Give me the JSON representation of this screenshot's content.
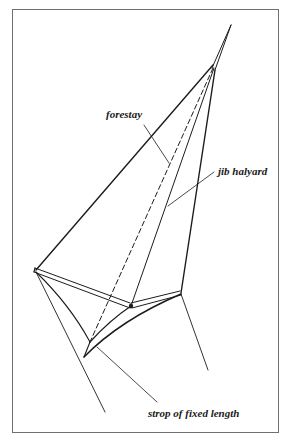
{
  "figure": {
    "labels": {
      "forestay": "forestay",
      "jib_halyard": "jib halyard",
      "strop": "strop of fixed length"
    },
    "colors": {
      "line": "#1c1c1c",
      "frame": "#6f6f6f",
      "background": "#ffffff"
    }
  }
}
